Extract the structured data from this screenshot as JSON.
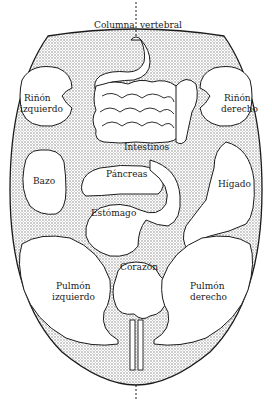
{
  "diagram": {
    "type": "tongue-organ-map",
    "colors": {
      "background": "#ffffff",
      "outline": "#1a1a1a",
      "stipple": "#8c8c8c",
      "organ_fill": "#ffffff"
    },
    "labels": {
      "spine_left": "Columna",
      "spine_right": "vertebral",
      "kidney_left_1": "Riñón",
      "kidney_left_2": "izquierdo",
      "kidney_right_1": "Riñón",
      "kidney_right_2": "derecho",
      "intestines": "Intestinos",
      "pancreas": "Páncreas",
      "spleen": "Bazo",
      "liver": "Hígado",
      "stomach": "Estómago",
      "heart": "Corazón",
      "lung_left_1": "Pulmón",
      "lung_left_2": "izquierdo",
      "lung_right_1": "Pulmón",
      "lung_right_2": "derecho"
    }
  }
}
